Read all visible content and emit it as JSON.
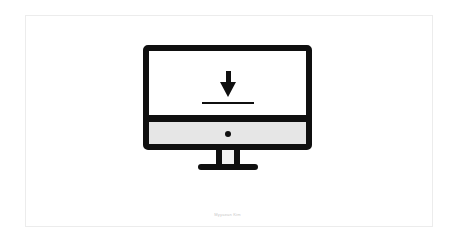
{
  "illustration": {
    "name": "desktop-computer-download-icon",
    "colors": {
      "outline": "#0f0f0f",
      "screen": "#ffffff",
      "chin": "#e6e6e6",
      "background": "#ffffff",
      "card_border": "#ececec"
    }
  },
  "caption": {
    "text": "Myyaean Kim"
  }
}
